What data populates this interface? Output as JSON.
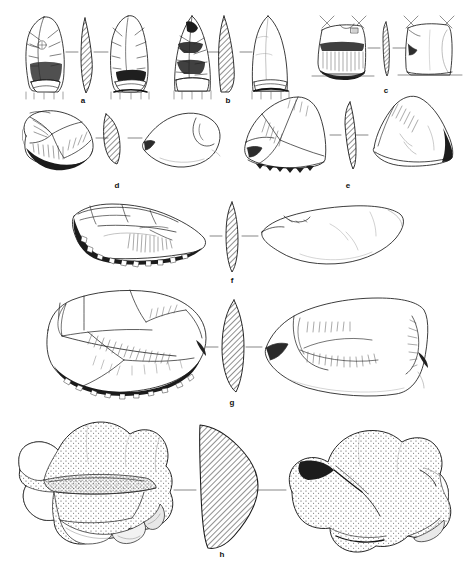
{
  "figure": {
    "kind": "archaeological-lithic-plate",
    "background_color": "#ffffff",
    "ink_color": "#1a1a1a",
    "hatch_color": "#333333",
    "stipple_color": "#444444",
    "artifact_count": 8,
    "views_per_artifact": [
      "dorsal",
      "section",
      "ventral"
    ],
    "caption_labels": [
      "a",
      "b",
      "c",
      "d",
      "e",
      "f",
      "g",
      "h"
    ]
  },
  "labels": [
    {
      "id": "a",
      "text": "a",
      "x": 83,
      "y": 101
    },
    {
      "id": "b",
      "text": "b",
      "x": 228,
      "y": 101
    },
    {
      "id": "c",
      "text": "c",
      "x": 386,
      "y": 91
    },
    {
      "id": "d",
      "text": "d",
      "x": 117,
      "y": 186
    },
    {
      "id": "e",
      "text": "e",
      "x": 348,
      "y": 186
    },
    {
      "id": "f",
      "text": "f",
      "x": 232,
      "y": 281
    },
    {
      "id": "g",
      "text": "g",
      "x": 232,
      "y": 403
    },
    {
      "id": "h",
      "text": "h",
      "x": 222,
      "y": 555
    }
  ],
  "artifacts": [
    {
      "id": "a",
      "description": "bifacial projectile point, lanceolate, basal thinning",
      "row": 1,
      "axis_y": 52,
      "dorsal": {
        "cx": 45,
        "cy": 54,
        "w": 40,
        "h": 74
      },
      "section": {
        "cx": 85,
        "cy": 54,
        "w": 22,
        "h": 70
      },
      "ventral": {
        "cx": 128,
        "cy": 54,
        "w": 40,
        "h": 74
      }
    },
    {
      "id": "b",
      "description": "bifacial projectile point, triangular, ground base",
      "row": 1,
      "axis_y": 52,
      "dorsal": {
        "cx": 192,
        "cy": 54,
        "w": 34,
        "h": 74
      },
      "section": {
        "cx": 228,
        "cy": 54,
        "w": 22,
        "h": 70
      },
      "ventral": {
        "cx": 268,
        "cy": 54,
        "w": 34,
        "h": 74
      }
    },
    {
      "id": "c",
      "description": "truncated flake / scraper fragment with retouched edge",
      "row": 1,
      "axis_y": 52,
      "dorsal": {
        "cx": 340,
        "cy": 48,
        "w": 48,
        "h": 54
      },
      "section": {
        "cx": 386,
        "cy": 48,
        "w": 11,
        "h": 50
      },
      "ventral": {
        "cx": 430,
        "cy": 48,
        "w": 45,
        "h": 54
      }
    },
    {
      "id": "d",
      "description": "side scraper on flake, steep retouch along lower edge",
      "row": 2,
      "axis_y": 138,
      "dorsal": {
        "cx": 55,
        "cy": 138,
        "w": 76,
        "h": 52
      },
      "section": {
        "cx": 117,
        "cy": 138,
        "w": 20,
        "h": 52
      },
      "ventral": {
        "cx": 180,
        "cy": 138,
        "w": 76,
        "h": 48
      }
    },
    {
      "id": "e",
      "description": "convergent scraper on flake, denticulate lower margin",
      "row": 2,
      "axis_y": 138,
      "dorsal": {
        "cx": 290,
        "cy": 135,
        "w": 86,
        "h": 68
      },
      "section": {
        "cx": 348,
        "cy": 135,
        "w": 14,
        "h": 68
      },
      "ventral": {
        "cx": 408,
        "cy": 135,
        "w": 82,
        "h": 64
      }
    },
    {
      "id": "f",
      "description": "elongated side scraper, heavy step retouch on long edge",
      "row": 3,
      "axis_y": 236,
      "dorsal": {
        "cx": 138,
        "cy": 236,
        "w": 140,
        "h": 62
      },
      "section": {
        "cx": 232,
        "cy": 236,
        "w": 16,
        "h": 64
      },
      "ventral": {
        "cx": 330,
        "cy": 236,
        "w": 140,
        "h": 54
      }
    },
    {
      "id": "g",
      "description": "large transverse scraper on flake, cortical back",
      "row": 4,
      "axis_y": 347,
      "dorsal": {
        "cx": 126,
        "cy": 347,
        "w": 160,
        "h": 96
      },
      "section": {
        "cx": 232,
        "cy": 347,
        "w": 24,
        "h": 88
      },
      "ventral": {
        "cx": 345,
        "cy": 347,
        "w": 160,
        "h": 88
      }
    },
    {
      "id": "h",
      "description": "core / heavy duty chopping tool, stippled cortex surface",
      "row": 5,
      "axis_y": 490,
      "dorsal": {
        "cx": 100,
        "cy": 490,
        "w": 168,
        "h": 124
      },
      "section": {
        "cx": 222,
        "cy": 485,
        "w": 64,
        "h": 130
      },
      "ventral": {
        "cx": 360,
        "cy": 490,
        "w": 160,
        "h": 124
      }
    }
  ]
}
